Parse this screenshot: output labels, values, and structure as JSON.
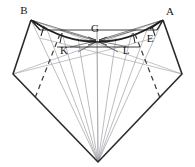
{
  "figure": {
    "canvas": {
      "width": 195,
      "height": 167,
      "background": "#ffffff"
    },
    "colors": {
      "heavy_stroke": "#2b2b2b",
      "light_stroke": "#8f8f96",
      "mid_stroke": "#5a5a60",
      "dashed_stroke": "#3a3a3a",
      "label_color": "#1a1a1a"
    },
    "labels": [
      {
        "id": "B",
        "text": "B",
        "x": 24,
        "y": 14
      },
      {
        "id": "A",
        "text": "A",
        "x": 170,
        "y": 15
      },
      {
        "id": "G",
        "text": "G",
        "x": 95,
        "y": 32
      },
      {
        "id": "E",
        "text": "E",
        "x": 150,
        "y": 42
      },
      {
        "id": "K",
        "text": "K",
        "x": 64,
        "y": 54
      },
      {
        "id": "L",
        "text": "L",
        "x": 126,
        "y": 54
      }
    ],
    "points": {
      "B": {
        "x": 31,
        "y": 20
      },
      "A": {
        "x": 163,
        "y": 20
      },
      "G": {
        "x": 97,
        "y": 41
      },
      "E": {
        "x": 155,
        "y": 38
      },
      "K": {
        "x": 70,
        "y": 47
      },
      "L": {
        "x": 128,
        "y": 47
      },
      "left_vertex": {
        "x": 13,
        "y": 74
      },
      "right_vertex": {
        "x": 182,
        "y": 74
      },
      "bottom_apex": {
        "x": 98,
        "y": 162
      },
      "horizontal_left": {
        "x": 40,
        "y": 30
      },
      "horizontal_right": {
        "x": 157,
        "y": 30
      }
    },
    "elements": {
      "outer_outline": "heavy polygon B - left vertex - bottom apex - right vertex - A",
      "horizontal_chord": "straight line from near B across to near A passing above G",
      "upper_arc": "concave curve from B through G region to A",
      "lower_chord": "line K to L through G",
      "fan_lines": "rays from bottom apex spreading to upper region and G",
      "dashed_segments": "two symmetric dashed lines on left and right flanks",
      "arrowheads": "multiple arrowheads converging at point G"
    }
  }
}
